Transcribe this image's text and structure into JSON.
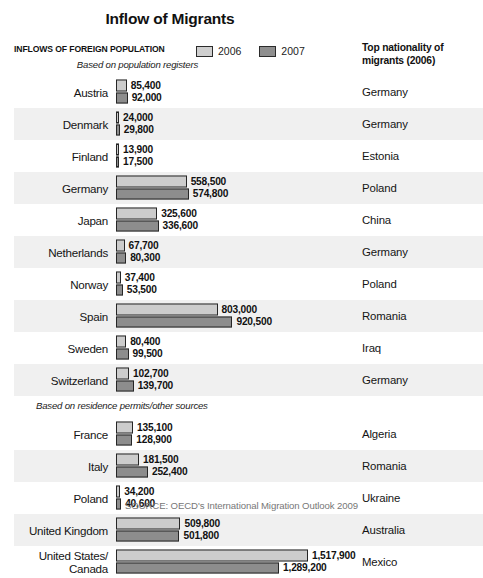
{
  "title": "Inflow of Migrants",
  "header": {
    "left_title": "INFLOWS OF FOREIGN POPULATION",
    "right_title": "Top nationality\nof migrants (2006)"
  },
  "legend": {
    "items": [
      {
        "label": "2006",
        "color": "#cccccc"
      },
      {
        "label": "2007",
        "color": "#8d8d8d"
      }
    ]
  },
  "sections": [
    {
      "subheading": "Based on population registers"
    },
    {
      "subheading": "Based on residence permits/other sources"
    }
  ],
  "source": "SOURCE: OECD's International Migration Outlook 2009",
  "chart_data": {
    "type": "bar",
    "title": "Inflow of Migrants",
    "xlabel": "",
    "ylabel": "",
    "orientation": "horizontal",
    "grouped": true,
    "legend_position": "top-center",
    "grid": false,
    "series": [
      {
        "name": "2006",
        "color": "#cccccc"
      },
      {
        "name": "2007",
        "color": "#8d8d8d"
      }
    ],
    "categories": [
      "Austria",
      "Denmark",
      "Finland",
      "Germany",
      "Japan",
      "Netherlands",
      "Norway",
      "Spain",
      "Sweden",
      "Switzerland",
      "France",
      "Italy",
      "Poland",
      "United Kingdom",
      "United States/Canada"
    ],
    "values_2006": [
      85400,
      24000,
      13900,
      558500,
      325600,
      67700,
      37400,
      803000,
      80400,
      102700,
      135100,
      181500,
      34200,
      509800,
      1517900
    ],
    "values_2007": [
      92000,
      29800,
      17500,
      574800,
      336600,
      80300,
      53500,
      920500,
      99500,
      139700,
      128900,
      252400,
      40600,
      501800,
      1289200
    ],
    "xlim": [
      0,
      1517900
    ],
    "annotations": "Top nationality of migrants (2006) listed per country",
    "groups": [
      {
        "subheading": "Based on population registers",
        "rows": [
          {
            "country": "Austria",
            "v2006": "85,400",
            "v2007": "92,000",
            "n2006": 85400,
            "n2007": 92000,
            "nationality": "Germany"
          },
          {
            "country": "Denmark",
            "v2006": "24,000",
            "v2007": "29,800",
            "n2006": 24000,
            "n2007": 29800,
            "nationality": "Germany"
          },
          {
            "country": "Finland",
            "v2006": "13,900",
            "v2007": "17,500",
            "n2006": 13900,
            "n2007": 17500,
            "nationality": "Estonia"
          },
          {
            "country": "Germany",
            "v2006": "558,500",
            "v2007": "574,800",
            "n2006": 558500,
            "n2007": 574800,
            "nationality": "Poland"
          },
          {
            "country": "Japan",
            "v2006": "325,600",
            "v2007": "336,600",
            "n2006": 325600,
            "n2007": 336600,
            "nationality": "China"
          },
          {
            "country": "Netherlands",
            "v2006": "67,700",
            "v2007": "80,300",
            "n2006": 67700,
            "n2007": 80300,
            "nationality": "Germany"
          },
          {
            "country": "Norway",
            "v2006": "37,400",
            "v2007": "53,500",
            "n2006": 37400,
            "n2007": 53500,
            "nationality": "Poland"
          },
          {
            "country": "Spain",
            "v2006": "803,000",
            "v2007": "920,500",
            "n2006": 803000,
            "n2007": 920500,
            "nationality": "Romania"
          },
          {
            "country": "Sweden",
            "v2006": "80,400",
            "v2007": "99,500",
            "n2006": 80400,
            "n2007": 99500,
            "nationality": "Iraq"
          },
          {
            "country": "Switzerland",
            "v2006": "102,700",
            "v2007": "139,700",
            "n2006": 102700,
            "n2007": 139700,
            "nationality": "Germany"
          }
        ]
      },
      {
        "subheading": "Based on residence permits/other sources",
        "rows": [
          {
            "country": "France",
            "v2006": "135,100",
            "v2007": "128,900",
            "n2006": 135100,
            "n2007": 128900,
            "nationality": "Algeria"
          },
          {
            "country": "Italy",
            "v2006": "181,500",
            "v2007": "252,400",
            "n2006": 181500,
            "n2007": 252400,
            "nationality": "Romania"
          },
          {
            "country": "Poland",
            "v2006": "34,200",
            "v2007": "40,600",
            "n2006": 34200,
            "n2007": 40600,
            "nationality": "Ukraine"
          },
          {
            "country": "United Kingdom",
            "v2006": "509,800",
            "v2007": "501,800",
            "n2006": 509800,
            "n2007": 501800,
            "nationality": "Australia"
          },
          {
            "country": "United States/\nCanada",
            "v2006": "1,517,900",
            "v2007": "1,289,200",
            "n2006": 1517900,
            "n2007": 1289200,
            "nationality": "Mexico"
          }
        ]
      }
    ]
  }
}
